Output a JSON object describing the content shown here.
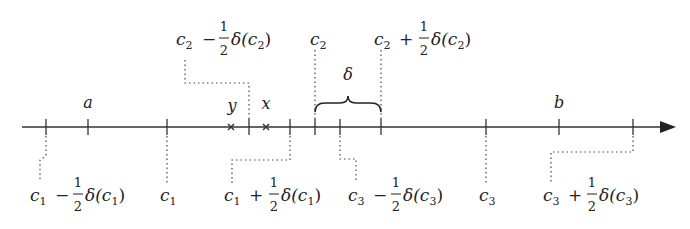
{
  "diagram": {
    "type": "number-line",
    "axis": {
      "x_start": 22,
      "x_end": 675,
      "y": 127,
      "arrow": "right"
    },
    "ticks": [
      {
        "id": "c1-minus",
        "x": 46
      },
      {
        "id": "a",
        "x": 88
      },
      {
        "id": "c1",
        "x": 167
      },
      {
        "id": "c2-minus",
        "x": 249
      },
      {
        "id": "c1-plus",
        "x": 290
      },
      {
        "id": "c2",
        "x": 315
      },
      {
        "id": "c3-minus",
        "x": 340
      },
      {
        "id": "c2-plus",
        "x": 381
      },
      {
        "id": "c3",
        "x": 486
      },
      {
        "id": "b",
        "x": 559
      },
      {
        "id": "c3-plus",
        "x": 633
      }
    ],
    "points": [
      {
        "label": "y",
        "x": 231,
        "marker": "cross"
      },
      {
        "label": "x",
        "x": 266,
        "marker": "cross"
      }
    ],
    "labels_above": {
      "a": "a",
      "b": "b",
      "y": "y",
      "x": "x",
      "delta": "δ",
      "c2": {
        "base": "c",
        "sub": "2"
      },
      "c2_minus": {
        "base": "c",
        "sub": "2",
        "op": "−",
        "num": "1",
        "den": "2",
        "func": "δ(c",
        "fsub": "2",
        "close": ")"
      },
      "c2_plus": {
        "base": "c",
        "sub": "2",
        "op": "+",
        "num": "1",
        "den": "2",
        "func": "δ(c",
        "fsub": "2",
        "close": ")"
      }
    },
    "labels_below": {
      "c1_minus": {
        "base": "c",
        "sub": "1",
        "op": "−",
        "num": "1",
        "den": "2",
        "func": "δ(c",
        "fsub": "1",
        "close": ")"
      },
      "c1": {
        "base": "c",
        "sub": "1"
      },
      "c1_plus": {
        "base": "c",
        "sub": "1",
        "op": "+",
        "num": "1",
        "den": "2",
        "func": "δ(c",
        "fsub": "1",
        "close": ")"
      },
      "c3_minus": {
        "base": "c",
        "sub": "3",
        "op": "−",
        "num": "1",
        "den": "2",
        "func": "δ(c",
        "fsub": "3",
        "close": ")"
      },
      "c3": {
        "base": "c",
        "sub": "3"
      },
      "c3_plus": {
        "base": "c",
        "sub": "3",
        "op": "+",
        "num": "1",
        "den": "2",
        "func": "δ(c",
        "fsub": "3",
        "close": ")"
      }
    },
    "brace": {
      "from_x": 315,
      "to_x": 381,
      "label": "δ"
    }
  }
}
